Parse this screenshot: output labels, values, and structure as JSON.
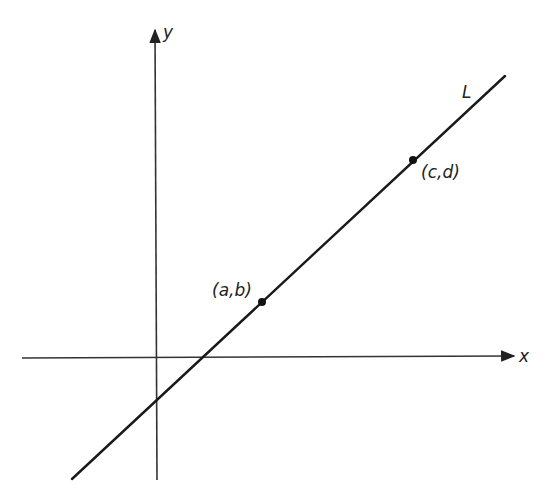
{
  "diagram": {
    "type": "coordinate-plane-line",
    "axes": {
      "x_label": "x",
      "y_label": "y"
    },
    "line": {
      "label": "L",
      "points": [
        {
          "label": "(a,b)"
        },
        {
          "label": "(c,d)"
        }
      ]
    }
  }
}
